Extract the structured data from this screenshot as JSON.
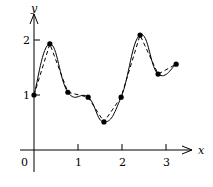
{
  "chart_data": {
    "type": "line",
    "title": "",
    "xlabel": "x",
    "ylabel": "y",
    "x_ticks": [
      "0",
      "1",
      "2",
      "3"
    ],
    "y_ticks": [
      "1",
      "2"
    ],
    "xlim": [
      -0.3,
      3.9
    ],
    "ylim": [
      -0.4,
      2.6
    ],
    "grid": false,
    "legend": "none",
    "series": [
      {
        "name": "data points",
        "style": "markers",
        "x": [
          0,
          0.36,
          0.77,
          1.23,
          1.59,
          1.98,
          2.41,
          2.82,
          3.23
        ],
        "y": [
          1.0,
          1.93,
          1.05,
          0.96,
          0.51,
          0.96,
          2.09,
          1.38,
          1.56
        ]
      },
      {
        "name": "piecewise linear interpolant",
        "style": "dashed",
        "x": [
          0,
          0.36,
          0.77,
          1.23,
          1.59,
          1.98,
          2.41,
          2.82,
          3.23
        ],
        "y": [
          1.0,
          1.93,
          1.05,
          0.96,
          0.51,
          0.96,
          2.09,
          1.38,
          1.56
        ]
      },
      {
        "name": "smooth curve",
        "style": "solid",
        "x": [
          0,
          0.36,
          0.77,
          1.23,
          1.59,
          1.98,
          2.41,
          2.82,
          3.23
        ],
        "y": [
          1.0,
          1.93,
          1.05,
          0.96,
          0.51,
          0.96,
          2.09,
          1.38,
          1.56
        ]
      }
    ]
  },
  "axes": {
    "x_label": "x",
    "y_label": "y",
    "origin_label": "0"
  }
}
